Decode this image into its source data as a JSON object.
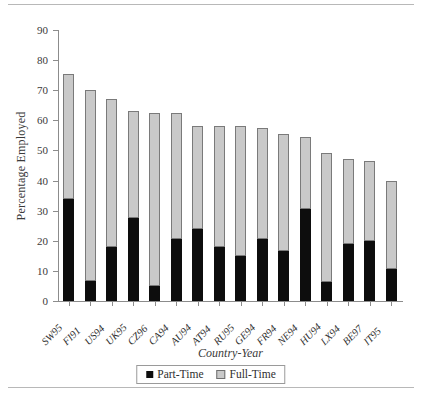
{
  "chart_data": {
    "type": "bar",
    "title": "",
    "xlabel": "Country-Year",
    "ylabel": "Percentage Employed",
    "ylim": [
      0,
      90
    ],
    "ytick_step": 10,
    "yticks": [
      0,
      10,
      20,
      30,
      40,
      50,
      60,
      70,
      80,
      90
    ],
    "grid": false,
    "stacked": true,
    "legend_position": "bottom-center",
    "categories": [
      "SW95",
      "FI91",
      "US94",
      "UK95",
      "CZ96",
      "CA94",
      "AU94",
      "AT94",
      "RU95",
      "GE94",
      "FR94",
      "NE94",
      "HU94",
      "LX94",
      "BE97",
      "IT95"
    ],
    "series": [
      {
        "name": "Part-Time",
        "color": "#0d0d0d",
        "values": [
          33.8,
          6.8,
          18.0,
          27.5,
          5.0,
          20.5,
          24.0,
          18.0,
          15.0,
          20.5,
          16.5,
          30.5,
          6.3,
          19.0,
          20.0,
          10.5
        ]
      },
      {
        "name": "Full-Time",
        "color": "#c9c9c9",
        "values": [
          41.7,
          63.2,
          49.0,
          35.5,
          57.5,
          42.0,
          34.0,
          40.0,
          43.0,
          37.0,
          39.0,
          24.0,
          42.7,
          28.0,
          26.5,
          29.5
        ]
      }
    ],
    "totals": [
      75.5,
      70.0,
      67.0,
      63.0,
      62.5,
      62.5,
      58.0,
      58.0,
      58.0,
      57.5,
      55.5,
      54.5,
      49.0,
      47.0,
      46.5,
      40.0
    ]
  },
  "legend": {
    "items": [
      {
        "label": "Part-Time",
        "swatch": "black-square-icon"
      },
      {
        "label": "Full-Time",
        "swatch": "gray-square-icon"
      }
    ]
  },
  "axes": {
    "y_title": "Percentage Employed",
    "x_title": "Country-Year"
  }
}
